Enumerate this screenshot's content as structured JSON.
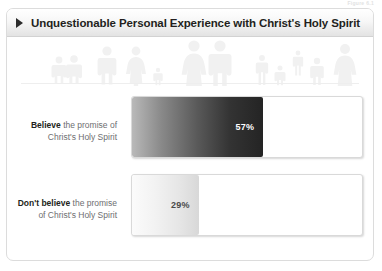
{
  "top_caption": "Figure 6.1",
  "header": {
    "bullet_icon": "triangle-right-icon",
    "title": "Unquestionable Personal Experience with Christ's Holy Spirit"
  },
  "decor": {
    "people_icon": "people-silhouettes-icon",
    "watermark_color": "#f1f1f1"
  },
  "chart_data": {
    "type": "bar",
    "title": "Unquestionable Personal Experience with Christ's Holy Spirit",
    "xlabel": "",
    "ylabel": "",
    "xlim": [
      0,
      100
    ],
    "grid": false,
    "legend": "none",
    "orientation": "horizontal",
    "categories": [
      "Believe the promise of Christ's Holy Spirit",
      "Don't believe the promise of Christ's Holy Spirit"
    ],
    "values": [
      57,
      29
    ],
    "value_labels": [
      "57%",
      "29%"
    ],
    "bars": [
      {
        "label_bold": "Believe",
        "label_rest_line1": " the promise of",
        "label_line2": "Christ's Holy Spirit",
        "value": 57,
        "value_label": "57%",
        "fill_style": "dark-gradient",
        "label_text_color": "#ffffff"
      },
      {
        "label_bold": "Don't believe",
        "label_rest_line1": " the promise",
        "label_line2": "of Christ's Holy Spirit",
        "value": 29,
        "value_label": "29%",
        "fill_style": "light-gradient",
        "label_text_color": "#4a4a4a"
      }
    ]
  }
}
